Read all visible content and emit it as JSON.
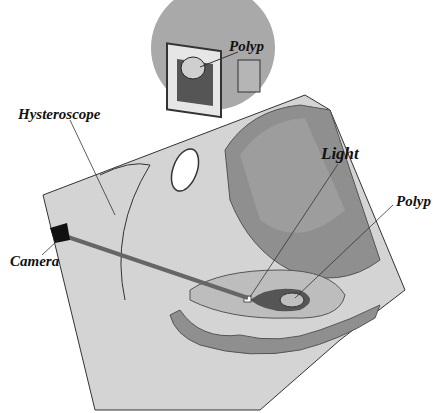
{
  "labels": {
    "monitor_polyp": "Polyp",
    "hysteroscope": "Hysteroscope",
    "camera": "Camera",
    "light": "Light",
    "polyp": "Polyp"
  },
  "colors": {
    "skin": "#d4d4d4",
    "tissue": "#bdbdbd",
    "organ": "#8f8f8f",
    "dark": "#555555",
    "inset_circle": "#a9a9a9"
  }
}
